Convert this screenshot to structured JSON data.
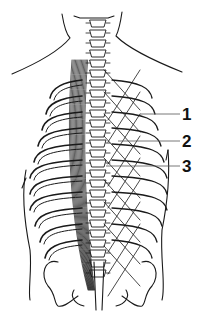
{
  "figure": {
    "style": "black ink line illustration on white",
    "colors": {
      "ink": "#1a1a1a",
      "background": "#ffffff",
      "leader_line": "#555555"
    }
  },
  "callouts": [
    {
      "number": "1"
    },
    {
      "number": "2"
    },
    {
      "number": "3"
    }
  ]
}
